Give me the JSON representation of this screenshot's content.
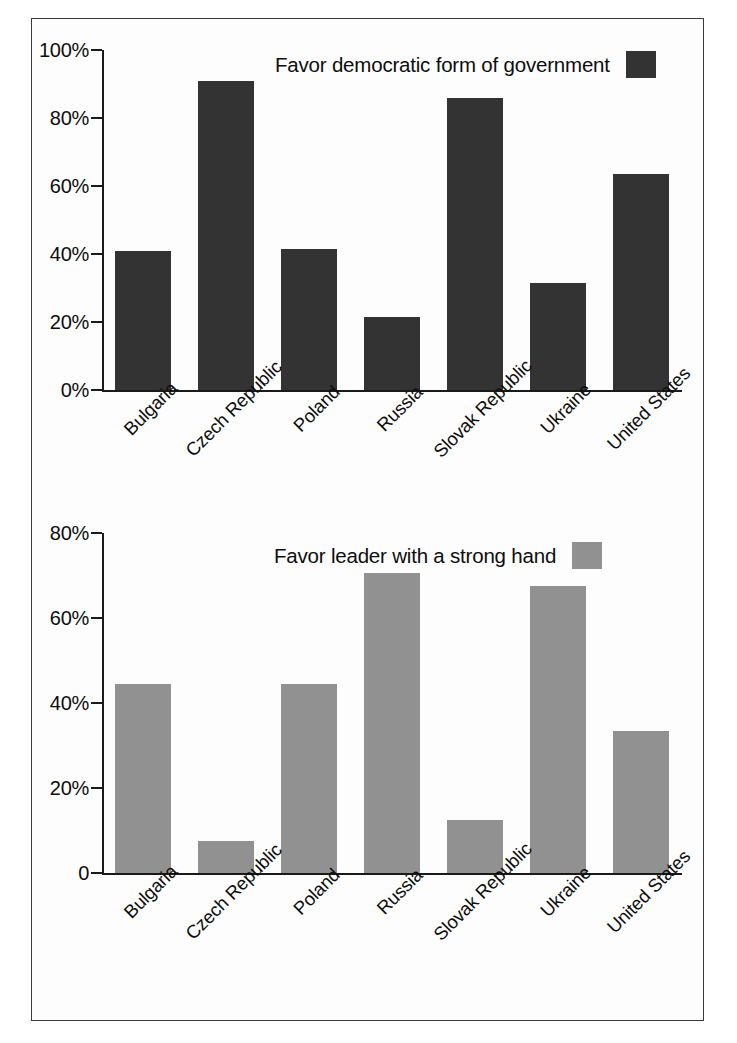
{
  "figure": {
    "border_color": "#3a3a3a",
    "background": "#fdfdfd"
  },
  "chart_data": [
    {
      "type": "bar",
      "panel": "top",
      "title": "",
      "legend_label": "Favor democratic form of government",
      "legend_position": "top-right",
      "series_color": "#333333",
      "categories": [
        "Bulgaria",
        "Czech Republic",
        "Poland",
        "Russia",
        "Slovak Republic",
        "Ukraine",
        "United States"
      ],
      "values": [
        41,
        91,
        41.5,
        21.5,
        86,
        31.5,
        63.5
      ],
      "xlabel": "",
      "ylabel": "",
      "ylim": [
        0,
        100
      ],
      "yticks": [
        0,
        20,
        40,
        60,
        80,
        100
      ],
      "ytick_labels": [
        "0%",
        "20%",
        "40%",
        "60%",
        "80%",
        "100%"
      ],
      "grid": false
    },
    {
      "type": "bar",
      "panel": "bottom",
      "title": "",
      "legend_label": "Favor leader with a strong hand",
      "legend_position": "top-right",
      "series_color": "#919191",
      "categories": [
        "Bulgaria",
        "Czech Republic",
        "Poland",
        "Russia",
        "Slovak Republic",
        "Ukraine",
        "United States"
      ],
      "values": [
        44.5,
        7.5,
        44.5,
        70.5,
        12.5,
        67.5,
        33.5
      ],
      "xlabel": "",
      "ylabel": "",
      "ylim": [
        0,
        80
      ],
      "yticks": [
        0,
        20,
        40,
        60,
        80
      ],
      "ytick_labels": [
        "0",
        "20%",
        "40%",
        "60%",
        "80%"
      ],
      "grid": false
    }
  ]
}
